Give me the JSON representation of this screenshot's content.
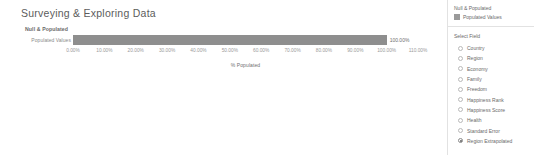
{
  "page_title": "Surveying & Exploring Data",
  "chart_panel": {
    "series_title": "Null & Populated",
    "row_label": "Populated Values",
    "axis_title": "% Populated"
  },
  "side_panel": {
    "legend_title": "Null & Populated",
    "legend_item_label": "Populated Values",
    "legend_swatch_color": "#9a9a9a",
    "select_field_title": "Select Field",
    "fields": [
      {
        "label": "Country",
        "selected": false
      },
      {
        "label": "Region",
        "selected": false
      },
      {
        "label": "Economy",
        "selected": false
      },
      {
        "label": "Family",
        "selected": false
      },
      {
        "label": "Freedom",
        "selected": false
      },
      {
        "label": "Happiness Rank",
        "selected": false
      },
      {
        "label": "Happiness Score",
        "selected": false
      },
      {
        "label": "Health",
        "selected": false
      },
      {
        "label": "Standard Error",
        "selected": false
      },
      {
        "label": "Region Extrapolated",
        "selected": true
      }
    ]
  },
  "chart_data": {
    "type": "bar",
    "orientation": "horizontal",
    "title": "Null & Populated",
    "xlabel": "% Populated",
    "ylabel": "",
    "categories": [
      "Populated Values"
    ],
    "values": [
      100.0
    ],
    "value_labels": [
      "100.00%"
    ],
    "bar_color": "#8e8e8e",
    "xlim": [
      0,
      110
    ],
    "xticks": [
      0,
      10,
      20,
      30,
      40,
      50,
      60,
      70,
      80,
      90,
      100,
      110
    ],
    "xtick_labels": [
      "0.00%",
      "10.00%",
      "20.00%",
      "30.00%",
      "40.00%",
      "50.00%",
      "60.00%",
      "70.00%",
      "80.00%",
      "90.00%",
      "100.00%",
      "110.00%"
    ],
    "grid": false,
    "legend": {
      "position": "right",
      "entries": [
        {
          "name": "Populated Values",
          "color": "#9a9a9a"
        }
      ]
    }
  }
}
